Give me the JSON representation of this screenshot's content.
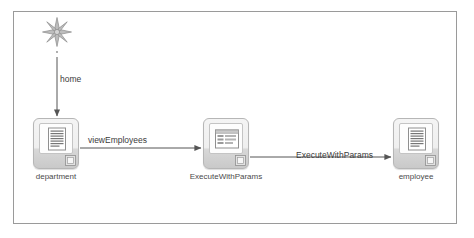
{
  "diagram": {
    "type": "navigation-flow",
    "background_color": "#ffffff",
    "frame_border_color": "#9a9a9a",
    "start_marker": {
      "icon": "asterisk-starburst-icon",
      "points": 8,
      "color": "#8c8c8c"
    },
    "nodes": [
      {
        "id": "department",
        "label": "department",
        "icon": "document-page-icon",
        "badge_icon": "small-page-badge-icon"
      },
      {
        "id": "ExecuteWithParams",
        "label": "ExecuteWithParams",
        "icon": "form-panel-icon",
        "badge_icon": "small-page-badge-icon"
      },
      {
        "id": "employee",
        "label": "employee",
        "icon": "document-page-icon",
        "badge_icon": "small-page-badge-icon"
      }
    ],
    "edges": [
      {
        "id": "home",
        "label": "home",
        "from": "start",
        "to": "department",
        "direction": "down"
      },
      {
        "id": "viewEmployees",
        "label": "viewEmployees",
        "from": "department",
        "to": "ExecuteWithParams",
        "direction": "right"
      },
      {
        "id": "ExecuteWithParams",
        "label": "ExecuteWithParams",
        "from": "ExecuteWithParams",
        "to": "employee",
        "direction": "right"
      }
    ],
    "edge_color": "#555555"
  }
}
